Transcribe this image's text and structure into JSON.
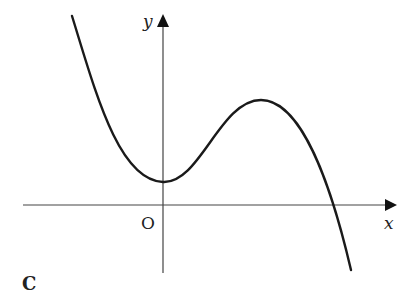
{
  "figure": {
    "panel_label": "C",
    "axes": {
      "x_label": "x",
      "y_label": "y",
      "origin_label": "O"
    },
    "curve": {
      "description": "Cubic-shaped curve with negative leading coefficient: decreasing from upper left to a local minimum on the y-axis above the origin, rising to a local maximum, then falling through the positive x-axis",
      "local_min": "on the y-axis (x = 0), above the x-axis",
      "local_max": "at positive x, above the local minimum",
      "x_intercept": "one root, at positive x beyond the local max"
    },
    "colors": {
      "curve": "#1a1a1a",
      "axes": "#333333",
      "background": "#ffffff"
    }
  }
}
